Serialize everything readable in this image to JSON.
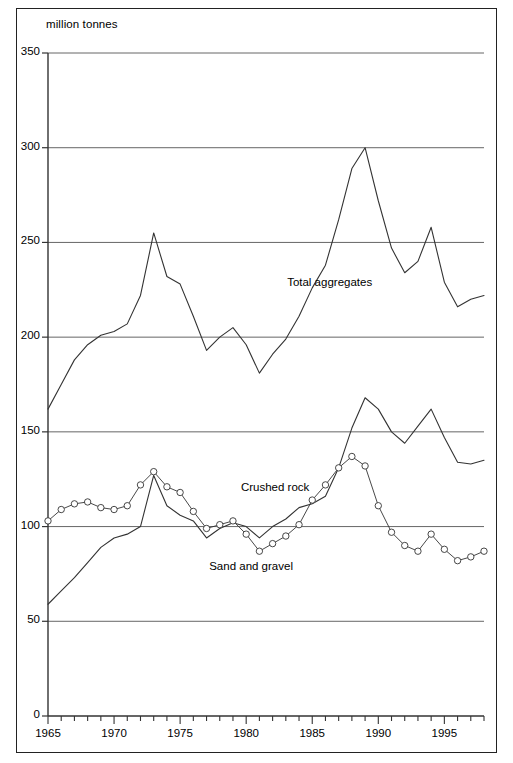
{
  "figure": {
    "unit_label": "million tonnes",
    "background": "#ffffff",
    "border_color": "#222222"
  },
  "chart_data": {
    "type": "line",
    "title": "",
    "subtitle": "",
    "xlabel": "",
    "ylabel": "million tonnes",
    "xlim": [
      1965,
      1998
    ],
    "ylim": [
      0,
      350
    ],
    "grid": true,
    "grid_axis": "y",
    "legend_position": "inline-annotations",
    "y_ticks": [
      0,
      50,
      100,
      150,
      200,
      250,
      300,
      350
    ],
    "y_tick_labels": [
      "0",
      "50",
      "100",
      "150",
      "200",
      "250",
      "300",
      "350"
    ],
    "x_ticks": [
      1965,
      1966,
      1967,
      1968,
      1969,
      1970,
      1971,
      1972,
      1973,
      1974,
      1975,
      1976,
      1977,
      1978,
      1979,
      1980,
      1981,
      1982,
      1983,
      1984,
      1985,
      1986,
      1987,
      1988,
      1989,
      1990,
      1991,
      1992,
      1993,
      1994,
      1995,
      1996,
      1997,
      1998
    ],
    "x_tick_labels_shown": [
      "1965",
      "1970",
      "1975",
      "1980",
      "1985",
      "1990",
      "1995"
    ],
    "x_tick_labels_shown_values": [
      1965,
      1970,
      1975,
      1980,
      1985,
      1990,
      1995
    ],
    "x": [
      1965,
      1966,
      1967,
      1968,
      1969,
      1970,
      1971,
      1972,
      1973,
      1974,
      1975,
      1976,
      1977,
      1978,
      1979,
      1980,
      1981,
      1982,
      1983,
      1984,
      1985,
      1986,
      1987,
      1988,
      1989,
      1990,
      1991,
      1992,
      1993,
      1994,
      1995,
      1996,
      1997,
      1998
    ],
    "series": [
      {
        "name": "Total aggregates",
        "label": "Total aggregates",
        "color": "#333333",
        "marker": "none",
        "line_width": 1.1,
        "label_x": 1983.1,
        "label_y": 228,
        "values": [
          162,
          175,
          188,
          196,
          201,
          203,
          207,
          222,
          255,
          232,
          228,
          211,
          193,
          200,
          205,
          196,
          181,
          191,
          199,
          211,
          226,
          238,
          262,
          289,
          300,
          272,
          247,
          234,
          240,
          258,
          229,
          216,
          220,
          222
        ]
      },
      {
        "name": "Crushed rock",
        "label": "Crushed rock",
        "color": "#333333",
        "marker": "none",
        "line_width": 1.1,
        "label_x": 1979.6,
        "label_y": 120,
        "values": [
          59,
          66,
          73,
          81,
          89,
          94,
          96,
          100,
          127,
          111,
          106,
          103,
          94,
          99,
          102,
          100,
          94,
          100,
          104,
          110,
          112,
          116,
          131,
          152,
          168,
          162,
          150,
          144,
          153,
          162,
          147,
          134,
          133,
          135
        ]
      },
      {
        "name": "Sand and gravel",
        "label": "Sand and gravel",
        "color": "#333333",
        "marker": "circle",
        "marker_size": 4.2,
        "line_width": 0.9,
        "label_x": 1977.2,
        "label_y": 78,
        "values": [
          103,
          109,
          112,
          113,
          110,
          109,
          111,
          122,
          129,
          121,
          118,
          108,
          99,
          101,
          103,
          96,
          87,
          91,
          95,
          101,
          114,
          122,
          131,
          137,
          132,
          111,
          97,
          90,
          87,
          96,
          88,
          82,
          84,
          87
        ]
      }
    ]
  }
}
